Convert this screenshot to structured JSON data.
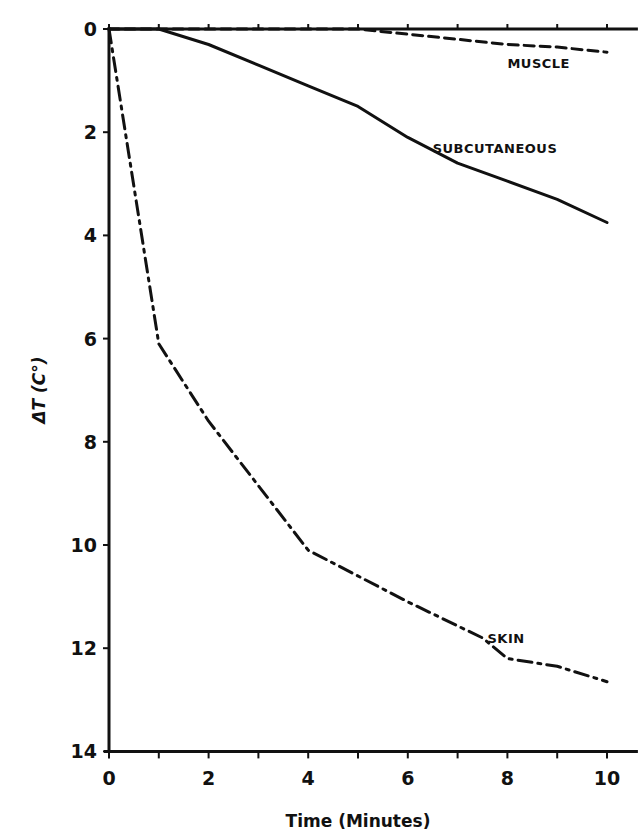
{
  "chart_data": {
    "type": "line",
    "title": "",
    "xlabel": "Time (Minutes)",
    "ylabel": "ΔT (C°)",
    "xlim": [
      0,
      10.5
    ],
    "ylim": [
      0,
      14
    ],
    "y_inverted": true,
    "grid": false,
    "legend": "inline labels",
    "x_ticks": [
      0,
      2,
      4,
      6,
      8,
      10
    ],
    "x_minor_ticks": [
      1,
      3,
      5,
      7,
      9
    ],
    "y_ticks": [
      0,
      2,
      4,
      6,
      8,
      10,
      12,
      14
    ],
    "series": [
      {
        "name": "MUSCLE",
        "style": "dashed",
        "x": [
          0,
          5,
          6,
          7,
          8,
          9,
          10
        ],
        "values": [
          0,
          0,
          0.1,
          0.2,
          0.3,
          0.35,
          0.45
        ],
        "label_pos": [
          8.0,
          0.75
        ]
      },
      {
        "name": "SUBCUTANEOUS",
        "style": "solid",
        "x": [
          0,
          1,
          2,
          3,
          4,
          5,
          6,
          7,
          8,
          9,
          10
        ],
        "values": [
          0,
          0,
          0.3,
          0.7,
          1.1,
          1.5,
          2.1,
          2.6,
          2.95,
          3.3,
          3.75
        ],
        "label_pos": [
          6.5,
          2.4
        ]
      },
      {
        "name": "SKIN",
        "style": "dash-dot",
        "x": [
          0,
          1,
          2,
          4,
          6,
          7.5,
          8,
          9,
          10
        ],
        "values": [
          0,
          6.1,
          7.6,
          10.1,
          11.1,
          11.8,
          12.2,
          12.35,
          12.65
        ],
        "label_pos": [
          7.6,
          11.9
        ]
      }
    ]
  }
}
